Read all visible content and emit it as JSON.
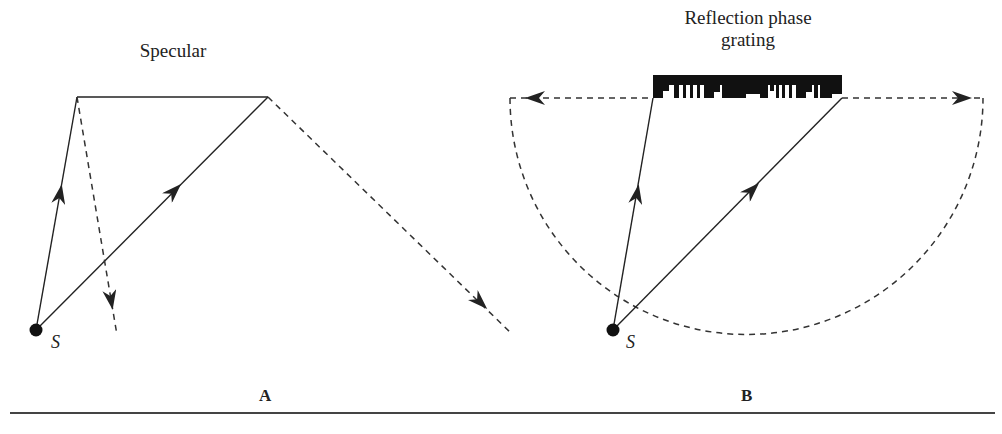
{
  "figure": {
    "panel_a": {
      "letter": "A",
      "surface_label": "Specular",
      "source_label": "S"
    },
    "panel_b": {
      "letter": "B",
      "surface_label_line1": "Reflection phase",
      "surface_label_line2": "grating",
      "source_label": "S"
    },
    "colors": {
      "ink": "#222222",
      "dashed": "#333333",
      "background": "#ffffff"
    }
  }
}
